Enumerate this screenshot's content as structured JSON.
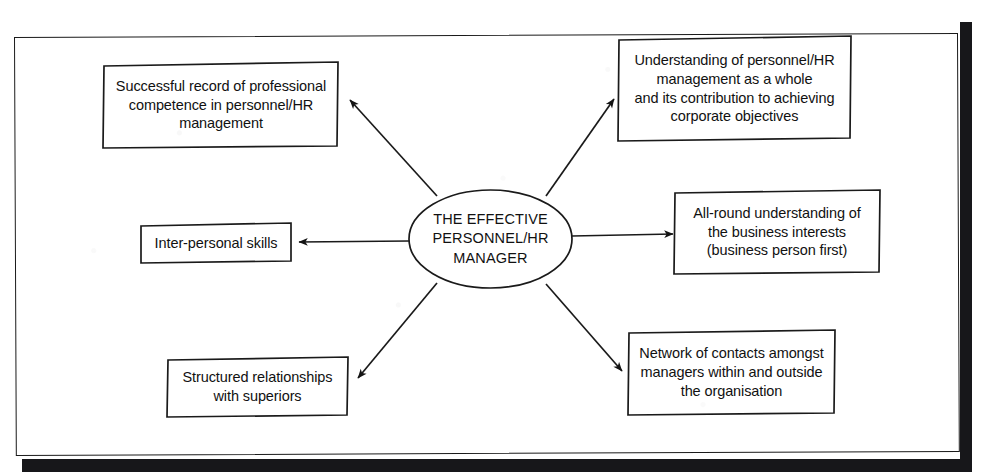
{
  "figure": {
    "title": "The Effective Personnel/HR Manager",
    "type": "spoke-diagram",
    "frame_color": "#1a1a1a",
    "sheet_color": "#ffffff",
    "shadow_color": "#17171a"
  },
  "center": {
    "label": "THE EFFECTIVE\nPERSONNEL/HR\nMANAGER",
    "shape": "ellipse"
  },
  "nodes": [
    {
      "id": "successful-record",
      "label": "Successful record of professional\ncompetence in personnel/HR\nmanagement",
      "position": "top-left"
    },
    {
      "id": "understanding-hr-whole",
      "label": "Understanding of personnel/HR\nmanagement as a whole\nand its contribution to achieving\ncorporate objectives",
      "position": "top-right"
    },
    {
      "id": "inter-personal-skills",
      "label": "Inter-personal skills",
      "position": "left"
    },
    {
      "id": "all-round-business",
      "label": "All-round understanding of\nthe business interests\n(business person first)",
      "position": "right"
    },
    {
      "id": "structured-relationships",
      "label": "Structured relationships\nwith superiors",
      "position": "bottom-left"
    },
    {
      "id": "network-of-contacts",
      "label": "Network of contacts amongst\nmanagers within and outside\nthe organisation",
      "position": "bottom-right"
    }
  ],
  "connectors": [
    {
      "id": "center-to-successful-record",
      "direction": "up-left",
      "arrowhead": "at-node"
    },
    {
      "id": "center-to-understanding-hr-whole",
      "direction": "up-right",
      "arrowhead": "at-node"
    },
    {
      "id": "center-to-inter-personal-skills",
      "direction": "left",
      "arrowhead": "at-node"
    },
    {
      "id": "center-to-all-round-business",
      "direction": "right",
      "arrowhead": "at-node"
    },
    {
      "id": "center-to-structured-relationships",
      "direction": "down-left",
      "arrowhead": "at-node"
    },
    {
      "id": "center-to-network-of-contacts",
      "direction": "down-right",
      "arrowhead": "at-node"
    }
  ]
}
